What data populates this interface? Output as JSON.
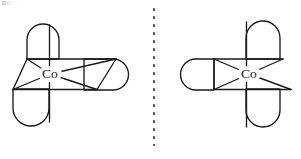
{
  "figure": {
    "name": "cobalt-complex-isomer-pair",
    "background_color": "#ffffff",
    "stroke_color": "#1a1a1a",
    "divider": {
      "name": "dashed-divider",
      "orientation": "vertical",
      "x": 154,
      "y_start": 8,
      "y_end": 146,
      "dash_pattern": "3 5",
      "color": "#2b2b2b"
    },
    "structures": [
      {
        "id": "left",
        "name": "cobalt-complex-left",
        "metal_label": "Co",
        "metal_center": {
          "x": 50,
          "y": 74
        },
        "coordination_number": 6,
        "chelate_count": 3,
        "ligands": [
          {
            "name": "chelate-lobe-top-left",
            "orientation": "vertical",
            "cx": 43,
            "cy": 43
          },
          {
            "name": "chelate-lobe-bottom-left",
            "orientation": "vertical",
            "cx": 31,
            "cy": 107
          },
          {
            "name": "chelate-lobe-right",
            "orientation": "horizontal",
            "cx": 103,
            "cy": 74
          }
        ]
      },
      {
        "id": "right",
        "name": "cobalt-complex-right",
        "metal_label": "Co",
        "metal_center": {
          "x": 249,
          "y": 74
        },
        "coordination_number": 6,
        "chelate_count": 3,
        "ligands": [
          {
            "name": "chelate-lobe-top-right",
            "orientation": "vertical",
            "cx": 262,
            "cy": 42
          },
          {
            "name": "chelate-lobe-bottom-right",
            "orientation": "vertical",
            "cx": 262,
            "cy": 107
          },
          {
            "name": "chelate-lobe-left",
            "orientation": "horizontal",
            "cx": 201,
            "cy": 74
          }
        ]
      }
    ]
  }
}
